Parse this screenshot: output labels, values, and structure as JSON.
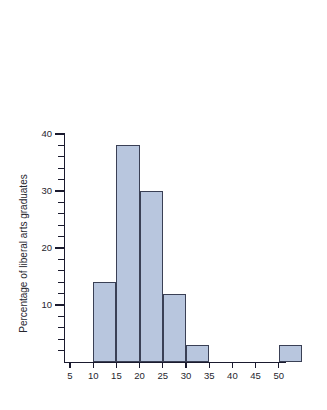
{
  "chart_data": {
    "type": "bar",
    "title": "",
    "subtitle": "",
    "xlabel": "",
    "ylabel": "Percentage of liberal arts graduates",
    "xlim": [
      0,
      57.5
    ],
    "ylim": [
      0,
      40
    ],
    "grid": false,
    "legend": null,
    "bin_width": 5,
    "categories": [
      "10-15",
      "15-20",
      "20-25",
      "25-30",
      "30-35",
      "35-40",
      "40-45",
      "45-50",
      "50-55"
    ],
    "bin_starts": [
      10,
      15,
      20,
      25,
      30,
      35,
      40,
      45,
      50
    ],
    "values": [
      14,
      38,
      30,
      12,
      3,
      0,
      0,
      0,
      3
    ],
    "x_ticks": [
      5,
      10,
      15,
      20,
      25,
      30,
      35,
      40,
      45,
      50
    ],
    "x_tick_labels": [
      "5",
      "10",
      "15",
      "20",
      "25",
      "30",
      "35",
      "40",
      "45",
      "50"
    ],
    "y_ticks_major": [
      10,
      20,
      30,
      40
    ],
    "y_tick_labels_major": [
      "10",
      "20",
      "30",
      "40"
    ],
    "y_ticks_minor": [
      2,
      4,
      6,
      8,
      12,
      14,
      16,
      18,
      22,
      24,
      26,
      28,
      32,
      34,
      36,
      38
    ],
    "colors": {
      "bar_fill": "#b8c6de",
      "bar_stroke": "#3a4055",
      "axis": "#1a1a2e",
      "text": "#26262e",
      "background": "#ffffff"
    }
  }
}
